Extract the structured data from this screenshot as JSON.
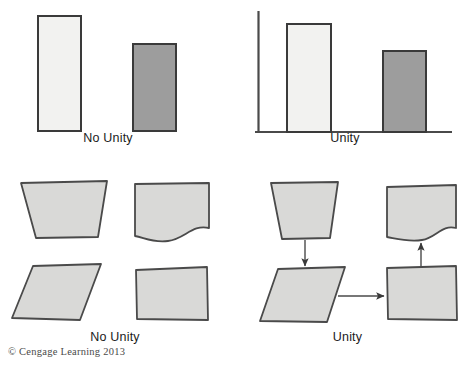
{
  "figure": {
    "title_text": "",
    "copyright": "© Cengage Learning 2013",
    "colors": {
      "light_fill": "#f2f2f0",
      "dark_fill": "#9d9d9d",
      "shape_fill": "#d9d9d7",
      "outline": "#4a4a4a",
      "outline_dark": "#3a3a3a",
      "axis": "#4a4a4a",
      "arrow": "#4a4a4a",
      "text": "#1b1b1b",
      "copyright_text": "#4a4a4a",
      "background": "#ffffff"
    }
  },
  "panels": {
    "top_left": {
      "caption": "No Unity",
      "bars": [
        {
          "name": "tall-light-bar",
          "fill": "light",
          "x": 38,
          "y": 16,
          "w": 43,
          "h": 115
        },
        {
          "name": "short-dark-bar",
          "fill": "dark",
          "x": 133,
          "y": 44,
          "w": 43,
          "h": 87
        }
      ]
    },
    "top_right": {
      "caption": "Unity",
      "axis": {
        "vertical_x": 258,
        "top_y": 11,
        "baseline_y": 132,
        "baseline_x_end": 452
      },
      "bars": [
        {
          "name": "tall-light-bar",
          "fill": "light",
          "x": 287,
          "y": 24,
          "w": 44,
          "h": 108
        },
        {
          "name": "short-dark-bar",
          "fill": "dark",
          "x": 383,
          "y": 51,
          "w": 43,
          "h": 81
        }
      ]
    },
    "bottom_left": {
      "caption": "No Unity",
      "shapes": [
        {
          "name": "trapezoid-shape",
          "kind": "trapezoid"
        },
        {
          "name": "wavy-bottom-shape",
          "kind": "wave"
        },
        {
          "name": "parallelogram-shape",
          "kind": "parallelogram"
        },
        {
          "name": "rectangle-shape",
          "kind": "rectangle"
        }
      ],
      "arrows": []
    },
    "bottom_right": {
      "caption": "Unity",
      "shapes": [
        {
          "name": "trapezoid-shape",
          "kind": "trapezoid"
        },
        {
          "name": "wavy-bottom-shape",
          "kind": "wave"
        },
        {
          "name": "parallelogram-shape",
          "kind": "parallelogram"
        },
        {
          "name": "rectangle-shape",
          "kind": "rectangle"
        }
      ],
      "arrows": [
        {
          "name": "arrow-trapezoid-to-parallelogram",
          "direction": "down"
        },
        {
          "name": "arrow-parallelogram-to-rectangle",
          "direction": "right"
        },
        {
          "name": "arrow-rectangle-to-wave",
          "direction": "up"
        }
      ]
    }
  }
}
